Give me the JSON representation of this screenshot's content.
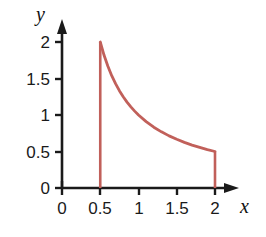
{
  "chart_data": {
    "type": "line",
    "title": "",
    "xlabel": "x",
    "ylabel": "y",
    "xlim": [
      0,
      2.25
    ],
    "ylim": [
      0,
      2.15
    ],
    "grid": false,
    "legend": null,
    "xticks": [
      "0",
      "0.5",
      "1",
      "1.5",
      "2"
    ],
    "xtick_values": [
      0,
      0.5,
      1,
      1.5,
      2
    ],
    "yticks": [
      "0",
      "0.5",
      "1",
      "1.5",
      "2"
    ],
    "ytick_values": [
      0,
      0.5,
      1,
      1.5,
      2
    ],
    "curve_color": "#C1605A",
    "axis_color": "#1a1a1a",
    "series": [
      {
        "name": "y = 1/x",
        "x": [
          0.5,
          0.55,
          0.6,
          0.65,
          0.7,
          0.75,
          0.8,
          0.85,
          0.9,
          0.95,
          1.0,
          1.1,
          1.2,
          1.3,
          1.4,
          1.5,
          1.6,
          1.7,
          1.8,
          1.9,
          2.0
        ],
        "values": [
          2.0,
          1.818,
          1.667,
          1.538,
          1.429,
          1.333,
          1.25,
          1.176,
          1.111,
          1.053,
          1.0,
          0.909,
          0.833,
          0.769,
          0.714,
          0.667,
          0.625,
          0.588,
          0.556,
          0.526,
          0.5
        ]
      },
      {
        "name": "left boundary x = 0.5",
        "x": [
          0.5,
          0.5
        ],
        "values": [
          0,
          2.0
        ]
      },
      {
        "name": "right boundary x = 2",
        "x": [
          2.0,
          2.0
        ],
        "values": [
          0,
          0.5
        ]
      }
    ],
    "annotations": []
  },
  "axis_labels": {
    "x": "x",
    "y": "y"
  }
}
